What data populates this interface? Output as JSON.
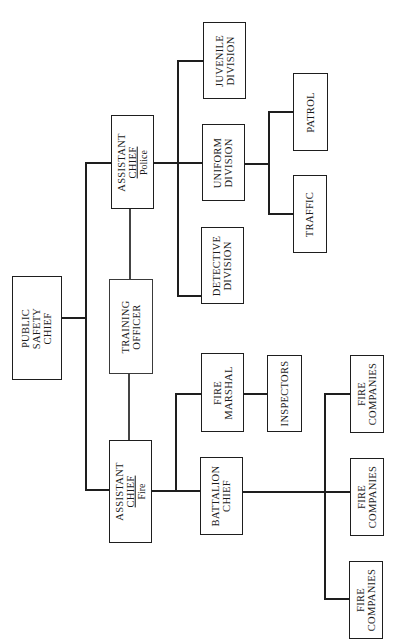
{
  "chart": {
    "orientation": "rotated 90 degrees counter-clockwise",
    "root": {
      "lines": [
        "PUBLIC",
        "SAFETY",
        "CHIEF"
      ]
    },
    "staff": {
      "lines": [
        "TRAINING",
        "OFFICER"
      ]
    },
    "police": {
      "head": {
        "lines": [
          "ASSISTANT",
          "CHIEF"
        ],
        "sub": "Police"
      },
      "juvenile": {
        "lines": [
          "JUVENILE",
          "DIVISION"
        ]
      },
      "uniform": {
        "lines": [
          "UNIFORM",
          "DIVISION"
        ]
      },
      "detective": {
        "lines": [
          "DETECTIVE",
          "DIVISION"
        ]
      },
      "patrol": {
        "lines": [
          "PATROL"
        ]
      },
      "traffic": {
        "lines": [
          "TRAFFIC"
        ]
      }
    },
    "fire": {
      "head": {
        "lines": [
          "ASSISTANT",
          "CHIEF"
        ],
        "sub": "Fire"
      },
      "marshal": {
        "lines": [
          "FIRE",
          "MARSHAL"
        ]
      },
      "inspectors": {
        "lines": [
          "INSPECTORS"
        ]
      },
      "battalion": {
        "lines": [
          "BATTALION",
          "CHIEF"
        ]
      },
      "companies": [
        {
          "lines": [
            "FIRE",
            "COMPANIES"
          ]
        },
        {
          "lines": [
            "FIRE",
            "COMPANIES"
          ]
        },
        {
          "lines": [
            "FIRE",
            "COMPANIES"
          ]
        }
      ]
    }
  }
}
